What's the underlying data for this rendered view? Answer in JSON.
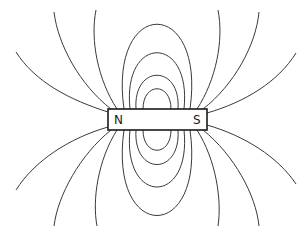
{
  "figure": {
    "magnet": {
      "north_label": "N",
      "south_label": "S"
    },
    "colors": {
      "background": "#ffffff",
      "line": "#3a3a3a",
      "outline": "#1a1a1a"
    }
  }
}
